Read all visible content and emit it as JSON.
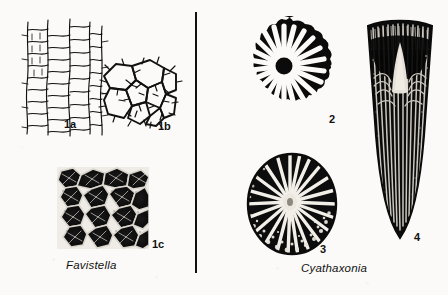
{
  "plate": {
    "background_color": "#fbfaf8",
    "ink_color": "#111111",
    "divider": {
      "name": "vertical-rule"
    }
  },
  "genera": [
    {
      "name": "Favistella",
      "side": "left",
      "caption": "Favistella"
    },
    {
      "name": "Cyathaxonia",
      "side": "right",
      "caption": "Cyathaxonia"
    }
  ],
  "figures": [
    {
      "id": "1a",
      "label": "1a",
      "genus": "Favistella",
      "description": "longitudinal section of colonial corallites with tabulae",
      "style": "line-drawing"
    },
    {
      "id": "1b",
      "label": "1b",
      "genus": "Favistella",
      "description": "transverse section showing polygonal corallites with septal spines",
      "style": "line-drawing"
    },
    {
      "id": "1c",
      "label": "1c",
      "genus": "Favistella",
      "description": "photographic transverse view of corallum surface",
      "style": "halftone"
    },
    {
      "id": "2",
      "label": "2",
      "genus": "Cyathaxonia",
      "description": "transverse section, radial septa, scalloped margin",
      "style": "halftone",
      "septa_count": 24
    },
    {
      "id": "3",
      "label": "3",
      "genus": "Cyathaxonia",
      "description": "oval transverse section with central columella",
      "style": "halftone",
      "septa_count": 28
    },
    {
      "id": "4",
      "label": "4",
      "genus": "Cyathaxonia",
      "description": "longitudinal section of horn coral with axial columella",
      "style": "halftone"
    }
  ]
}
